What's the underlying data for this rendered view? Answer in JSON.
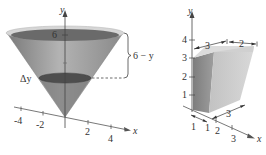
{
  "figure_left": {
    "title": "Cone with horizontal slice",
    "y_axis_label": "y",
    "x_axis_label": "x",
    "y_tick_label": "6",
    "x_tick_labels": [
      "-4",
      "-2",
      "2",
      "4"
    ],
    "slice_label": "Δy",
    "bracket_label": "6 − y",
    "colors": {
      "cone_side": "#9a9a9a",
      "cone_top": "#6e6e6e",
      "slice": "#555555",
      "rim": "#cfcfcf"
    }
  },
  "figure_right": {
    "title": "Frustum-like solid (box)",
    "y_axis_label": "y",
    "x_axis_label": "x",
    "y_tick_labels": [
      "1",
      "2",
      "3",
      "4"
    ],
    "x_tick_labels": [
      "2",
      "3"
    ],
    "z_tick_label": "1",
    "dim_top_left": "3",
    "dim_top_right": "2",
    "dim_bottom": "3",
    "dim_base_left": "1",
    "colors": {
      "front": "#8c8c8c",
      "side": "#bdbdbd",
      "top": "#d4d4d4"
    }
  }
}
